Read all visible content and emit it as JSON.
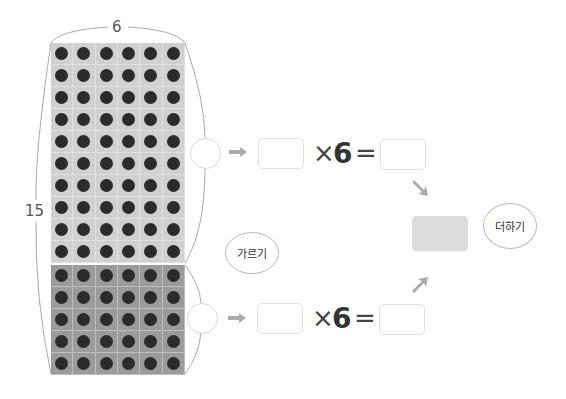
{
  "figure": {
    "width_label": "6",
    "height_label": "15",
    "grid": {
      "columns": 6,
      "rows_total": 15,
      "rows_top": 10,
      "rows_bottom": 5,
      "colors": {
        "top": "#d0d0d0",
        "bottom": "#9b9b9b",
        "dot": "#2b2b2b"
      }
    }
  },
  "equations": [
    {
      "multiply_sign": "×",
      "factor": "6",
      "equals_sign": "=",
      "blank_circle": "",
      "blank_left": "",
      "blank_right": ""
    },
    {
      "multiply_sign": "×",
      "factor": "6",
      "equals_sign": "=",
      "blank_circle": "",
      "blank_left": "",
      "blank_right": ""
    }
  ],
  "bubbles": {
    "split_label": "가르기",
    "add_label": "더하기"
  },
  "result_box": {
    "value": "",
    "color": "#dcdcdc"
  }
}
